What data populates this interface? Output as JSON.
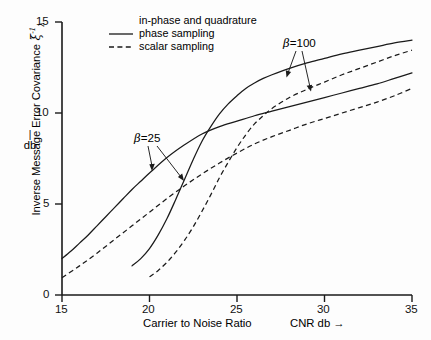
{
  "chart_data": {
    "type": "line",
    "title": "",
    "xlabel": "Carrier to Noise Ratio",
    "xunit": "CNR   db →",
    "ylabel": "Inverse Message Error Covariance",
    "ylabel_symbol": "ξ",
    "ylabel_sup": "-1",
    "ylabel_sub": "λ",
    "yunit": "db",
    "xlim": [
      15,
      35
    ],
    "ylim": [
      0,
      15
    ],
    "xticks": [
      15,
      20,
      25,
      30,
      35
    ],
    "yticks": [
      0,
      5,
      10,
      15
    ],
    "grid": false,
    "legend_position": "top-center",
    "legend": {
      "title": "in-phase and quadrature",
      "entries": [
        {
          "label": "phase sampling",
          "style": "solid"
        },
        {
          "label": "scalar sampling",
          "style": "dashed"
        }
      ]
    },
    "annotations": [
      {
        "text": "β =25",
        "symbol": "β",
        "value": "=25",
        "x": 21.2,
        "y": 11.45
      },
      {
        "text": "β =100",
        "symbol": "β",
        "value": "=100",
        "x": 29.5,
        "y": 13.85
      }
    ],
    "series": [
      {
        "name": "beta=25, phase sampling",
        "style": "solid",
        "beta": 25,
        "sampling": "phase sampling",
        "x": [
          19.0,
          19.5,
          20.0,
          20.5,
          21.0,
          21.5,
          22.0,
          22.5,
          23.0,
          23.5,
          24.0,
          24.5,
          25.0,
          25.5,
          26.0,
          26.5,
          27.0,
          28.0,
          29.0,
          30.0,
          31.0,
          32.0,
          33.0,
          34.0,
          35.0
        ],
        "y": [
          1.6,
          2.0,
          2.55,
          3.3,
          4.2,
          5.25,
          6.35,
          7.45,
          8.45,
          9.25,
          9.95,
          10.5,
          10.95,
          11.35,
          11.65,
          11.9,
          12.1,
          12.45,
          12.75,
          13.0,
          13.25,
          13.45,
          13.65,
          13.85,
          14.0
        ]
      },
      {
        "name": "beta=25, scalar sampling",
        "style": "dashed",
        "beta": 25,
        "sampling": "scalar sampling",
        "x": [
          20.0,
          20.5,
          21.0,
          21.5,
          22.0,
          22.5,
          23.0,
          23.5,
          24.0,
          24.5,
          25.0,
          25.5,
          26.0,
          26.5,
          27.0,
          28.0,
          29.0,
          30.0,
          31.0,
          32.0,
          33.0,
          34.0,
          35.0
        ],
        "y": [
          1.0,
          1.35,
          1.8,
          2.35,
          3.0,
          3.75,
          4.6,
          5.5,
          6.45,
          7.3,
          8.1,
          8.8,
          9.4,
          9.85,
          10.25,
          10.85,
          11.3,
          11.7,
          12.1,
          12.45,
          12.8,
          13.15,
          13.45
        ]
      },
      {
        "name": "beta=100, phase sampling",
        "style": "solid",
        "beta": 100,
        "sampling": "phase sampling",
        "x": [
          15.0,
          15.5,
          16.0,
          16.5,
          17.0,
          17.5,
          18.0,
          18.5,
          19.0,
          19.5,
          20.0,
          21.0,
          22.0,
          23.0,
          24.0,
          25.0,
          26.0,
          27.0,
          28.0,
          29.0,
          30.0,
          31.0,
          32.0,
          33.0,
          34.0,
          35.0
        ],
        "y": [
          2.0,
          2.4,
          2.85,
          3.3,
          3.8,
          4.3,
          4.8,
          5.3,
          5.8,
          6.25,
          6.7,
          7.55,
          8.25,
          8.85,
          9.25,
          9.55,
          9.85,
          10.1,
          10.35,
          10.6,
          10.85,
          11.1,
          11.35,
          11.6,
          11.9,
          12.2
        ]
      },
      {
        "name": "beta=100, scalar sampling",
        "style": "dashed",
        "beta": 100,
        "sampling": "scalar sampling",
        "x": [
          15.0,
          16.0,
          17.0,
          18.0,
          19.0,
          20.0,
          21.0,
          22.0,
          23.0,
          24.0,
          25.0,
          26.0,
          27.0,
          28.0,
          29.0,
          30.0,
          31.0,
          32.0,
          33.0,
          34.0,
          35.0
        ],
        "y": [
          0.95,
          1.6,
          2.3,
          3.05,
          3.8,
          4.55,
          5.3,
          6.0,
          6.65,
          7.25,
          7.8,
          8.3,
          8.7,
          9.05,
          9.4,
          9.7,
          10.0,
          10.3,
          10.6,
          10.95,
          11.35
        ]
      }
    ]
  },
  "axes": {
    "y_tick_labels": [
      "15",
      "10",
      "5",
      "0"
    ],
    "x_tick_labels": [
      "15",
      "20",
      "25",
      "30",
      "35"
    ]
  },
  "colors": {
    "line": "#1a1a1a",
    "background": "#fdfdfd",
    "axis": "#1a1a1a"
  }
}
